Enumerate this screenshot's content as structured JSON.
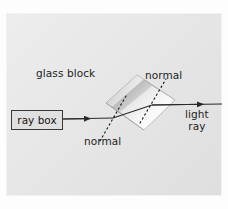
{
  "figure": {
    "background_color": "#e3e3e3",
    "border_color": "#f2f2f2",
    "ink_color": "#1d1d1d",
    "labels": {
      "glass_block": "glass block",
      "normal_top": "normal",
      "normal_bottom": "normal",
      "light_ray_line1": "light",
      "light_ray_line2": "ray",
      "ray_box": "ray box"
    },
    "glass_block": {
      "fill_light": "#ffffff",
      "fill_dark": "#9a9a9a",
      "edge_color": "#8d8d8d",
      "points": "106,103 137,75 175,100 144,130"
    },
    "rays": {
      "incident": {
        "from": [
          63,
          119
        ],
        "to": [
          113,
          118
        ],
        "arrow_at": [
          88,
          118
        ]
      },
      "internal": {
        "from": [
          113,
          118
        ],
        "to": [
          152,
          105
        ]
      },
      "emergent": {
        "from": [
          152,
          105
        ],
        "to": [
          222,
          104
        ],
        "arrow_at": [
          201,
          104
        ]
      },
      "color": "#2a2a2a"
    },
    "normals": {
      "entry": {
        "from": [
          100,
          141
        ],
        "to": [
          126,
          96
        ],
        "style": "dotted"
      },
      "exit": {
        "from": [
          140,
          123
        ],
        "to": [
          166,
          79
        ],
        "style": "dotted"
      },
      "color": "#1d1d1d"
    }
  }
}
